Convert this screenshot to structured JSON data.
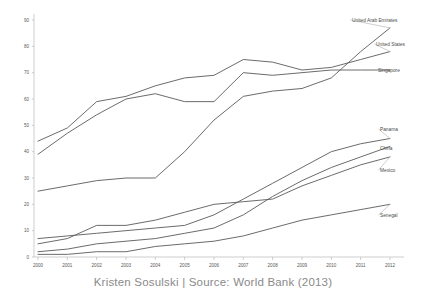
{
  "chart_data": {
    "type": "line",
    "title": "",
    "subtitle": "",
    "xlabel": "",
    "ylabel": "",
    "caption": "Kristen Sosulski | Source: World Bank (2013)",
    "grid": false,
    "legend_position": "right-inline-labels",
    "xlim": [
      2000,
      2012
    ],
    "ylim": [
      0,
      90
    ],
    "ytick_step": 10,
    "categories": [
      2000,
      2001,
      2002,
      2003,
      2004,
      2005,
      2006,
      2007,
      2008,
      2009,
      2010,
      2011,
      2012
    ],
    "xtick_labels": [
      "2000",
      "2001",
      "2002",
      "2003",
      "2004",
      "2005",
      "2006",
      "2007",
      "2008",
      "2009",
      "2010",
      "2011",
      "2012"
    ],
    "ytick_labels": [
      "0",
      "10",
      "20",
      "30",
      "40",
      "50",
      "60",
      "70",
      "80",
      "90"
    ],
    "series": [
      {
        "name": "United Arab Emirates",
        "values": [
          25,
          27,
          29,
          30,
          30,
          40,
          52,
          61,
          63,
          64,
          68,
          78,
          87
        ]
      },
      {
        "name": "United States",
        "values": [
          44,
          49,
          59,
          61,
          65,
          68,
          69,
          75,
          74,
          71,
          72,
          75,
          78
        ]
      },
      {
        "name": "Singapore",
        "values": [
          39,
          47,
          54,
          60,
          62,
          59,
          59,
          70,
          69,
          70,
          71,
          71,
          71
        ]
      },
      {
        "name": "Panama",
        "values": [
          7,
          8,
          9,
          10,
          11,
          12,
          16,
          22,
          28,
          34,
          40,
          43,
          45
        ]
      },
      {
        "name": "China",
        "values": [
          2,
          3,
          5,
          6,
          7,
          9,
          11,
          16,
          23,
          29,
          34,
          38,
          42
        ]
      },
      {
        "name": "Mexico",
        "values": [
          5,
          7,
          12,
          12,
          14,
          17,
          20,
          21,
          22,
          27,
          31,
          35,
          38
        ]
      },
      {
        "name": "Senegal",
        "values": [
          1,
          1,
          2,
          2,
          4,
          5,
          6,
          8,
          11,
          14,
          16,
          18,
          20
        ]
      }
    ],
    "label_anchors": [
      {
        "name": "United Arab Emirates",
        "x": 352,
        "y": 20
      },
      {
        "name": "United States",
        "x": 376,
        "y": 44
      },
      {
        "name": "Singapore",
        "x": 378,
        "y": 70
      },
      {
        "name": "Panama",
        "x": 380,
        "y": 129
      },
      {
        "name": "China",
        "x": 380,
        "y": 148
      },
      {
        "name": "Mexico",
        "x": 380,
        "y": 170
      },
      {
        "name": "Senegal",
        "x": 380,
        "y": 215
      }
    ]
  },
  "colors": {
    "line": "#5a5a5a",
    "axis": "#b9b9b9",
    "tick_text": "#5a5a5a",
    "label_text": "#4a4a4a",
    "caption_text": "#8a8a8a",
    "background": "#ffffff"
  }
}
